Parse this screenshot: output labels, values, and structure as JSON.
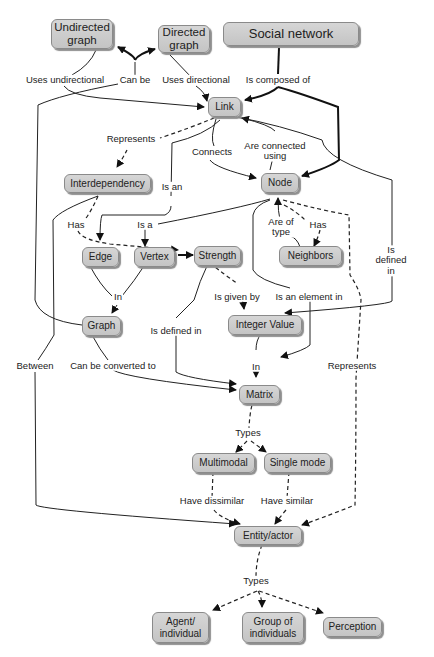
{
  "diagram": {
    "type": "concept-map",
    "title": "Social network",
    "nodes": {
      "undirected": "Undirected\ngraph",
      "directed": "Directed\ngraph",
      "social": "Social network",
      "link": "Link",
      "interdependency": "Interdependency",
      "node": "Node",
      "edge": "Edge",
      "vertex": "Vertex",
      "strength": "Strength",
      "neighbors": "Neighbors",
      "graph": "Graph",
      "integer": "Integer Value",
      "matrix": "Matrix",
      "multimodal": "Multimodal",
      "single": "Single mode",
      "entity": "Entity/actor",
      "agent": "Agent/\nindividual",
      "group": "Group of\nindividuals",
      "perception": "Perception"
    },
    "labels": {
      "uses_undirectional": "Uses undirectional",
      "can_be": "Can be",
      "uses_directional": "Uses directional",
      "is_composed_of": "Is composed of",
      "represents_1": "Represents",
      "connects": "Connects",
      "are_connected_using": "Are connected\nusing",
      "is_an": "Is an",
      "has_1": "Has",
      "is_a": "Is a",
      "are_of_type": "Are of\ntype",
      "has_2": "Has",
      "is_defined_in_right": "Is defined in",
      "in_1": "In",
      "is_given_by": "Is given by",
      "is_an_element_in": "Is an element in",
      "is_defined_in_left": "Is defined in",
      "between": "Between",
      "can_be_converted_to": "Can be converted to",
      "in_2": "In",
      "represents_2": "Represents",
      "types_1": "Types",
      "have_dissimilar": "Have dissimilar",
      "have_similar": "Have similar",
      "types_2": "Types"
    },
    "edges": [
      {
        "from": "Graph",
        "label": "Can be",
        "to": [
          "Undirected graph",
          "Directed graph"
        ],
        "style": "solid-thick"
      },
      {
        "from": "Undirected graph",
        "label": "Uses undirectional",
        "to": "Link",
        "style": "solid"
      },
      {
        "from": "Directed graph",
        "label": "Uses directional",
        "to": "Link",
        "style": "solid"
      },
      {
        "from": "Social network",
        "label": "Is composed of",
        "to": [
          "Link",
          "Node"
        ],
        "style": "solid-thick"
      },
      {
        "from": "Link",
        "label": "Represents",
        "to": "Interdependency",
        "style": "dashed"
      },
      {
        "from": "Link",
        "label": "Connects",
        "to": "Node",
        "style": "solid"
      },
      {
        "from": "Node",
        "label": "Are connected using",
        "to": "Link",
        "style": "solid"
      },
      {
        "from": "Link",
        "label": "Is an",
        "to": "Edge",
        "style": "solid"
      },
      {
        "from": "Interdependency",
        "label": "Has",
        "to": "Strength",
        "style": "dashed"
      },
      {
        "from": "Node",
        "label": "Is a",
        "to": "Vertex",
        "style": "solid"
      },
      {
        "from": "Vertex",
        "to": "Strength",
        "style": "solid-thick"
      },
      {
        "from": "Neighbors",
        "label": "Are of type",
        "to": "Node",
        "style": "solid"
      },
      {
        "from": "Node",
        "label": "Has",
        "to": "Neighbors",
        "style": "dashed"
      },
      {
        "from": "Link",
        "label": "Is defined in",
        "to": "Matrix",
        "style": "solid"
      },
      {
        "from": "Edge",
        "label": "In",
        "to": "Graph",
        "style": "solid"
      },
      {
        "from": "Vertex",
        "label": "In",
        "to": "Graph",
        "style": "solid"
      },
      {
        "from": "Strength",
        "label": "Is given by",
        "to": "Integer Value",
        "style": "dashed"
      },
      {
        "from": "Node",
        "label": "Is an element in",
        "to": "Matrix",
        "style": "solid"
      },
      {
        "from": "Strength",
        "label": "Is defined in",
        "to": "Matrix",
        "style": "solid"
      },
      {
        "from": "Interdependency",
        "label": "Between",
        "to": "Entity/actor",
        "style": "solid"
      },
      {
        "from": "Graph",
        "label": "Can be converted to",
        "to": "Matrix",
        "style": "solid"
      },
      {
        "from": "Integer Value",
        "label": "In",
        "to": "Matrix",
        "style": "solid"
      },
      {
        "from": "Node",
        "label": "Represents",
        "to": "Entity/actor",
        "style": "dashed"
      },
      {
        "from": "Matrix",
        "label": "Types",
        "to": [
          "Multimodal",
          "Single mode"
        ],
        "style": "dashed"
      },
      {
        "from": "Multimodal",
        "label": "Have dissimilar",
        "to": "Entity/actor",
        "style": "dashed"
      },
      {
        "from": "Single mode",
        "label": "Have similar",
        "to": "Entity/actor",
        "style": "dashed"
      },
      {
        "from": "Entity/actor",
        "label": "Types",
        "to": [
          "Agent/individual",
          "Group of individuals",
          "Perception"
        ],
        "style": "dash-dot"
      }
    ]
  },
  "colors": {
    "node_fill": "#cccccc",
    "node_border": "#8a8a8a",
    "line": "#222222",
    "background": "#ffffff"
  }
}
